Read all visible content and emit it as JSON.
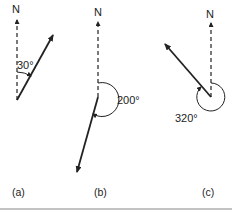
{
  "diagram": {
    "colors": {
      "line": "#222222",
      "rule": "#888888"
    },
    "panels": [
      {
        "id": "a",
        "north_label": "N",
        "angle_label": "30°",
        "bearing_deg": 30,
        "caption": "(a)"
      },
      {
        "id": "b",
        "north_label": "N",
        "angle_label": "200°",
        "bearing_deg": 200,
        "caption": "(b)"
      },
      {
        "id": "c",
        "north_label": "N",
        "angle_label": "320°",
        "bearing_deg": 320,
        "caption": "(c)"
      }
    ]
  }
}
